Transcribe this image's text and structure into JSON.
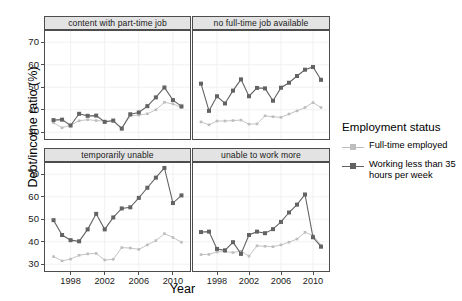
{
  "chart_data": {
    "type": "line",
    "title": "",
    "xlabel": "Year",
    "ylabel": "Debt/income ratio (%)",
    "xlim": [
      1995,
      2012
    ],
    "ylim": [
      27,
      75
    ],
    "xticks": [
      1998,
      2002,
      2006,
      2010
    ],
    "yticks_top": [
      30,
      40,
      50,
      60,
      70
    ],
    "yticks_bottom": [
      30,
      40,
      50,
      60,
      70
    ],
    "grid": true,
    "legend_title": "Employment status",
    "legend_position": "right",
    "series_names": [
      "Full-time employed",
      "Working less than 35 hours per week"
    ],
    "series_colors": [
      "#bdbdbd",
      "#636363"
    ],
    "facets": [
      {
        "label": "content with part-time job",
        "position": "top-left",
        "series": [
          {
            "name": "Full-time employed",
            "color": "#bdbdbd",
            "x": [
              1996,
              1997,
              1998,
              1999,
              2000,
              2001,
              2002,
              2003,
              2004,
              2005,
              2006,
              2007,
              2008,
              2009,
              2010,
              2011
            ],
            "values": [
              34.2,
              32.0,
              33.2,
              35.1,
              35.6,
              35.2,
              35.0,
              34.8,
              32.0,
              37.3,
              37.6,
              38.2,
              40.0,
              43.3,
              42.6,
              41.0
            ]
          },
          {
            "name": "Working less than 35 hours per week",
            "color": "#636363",
            "x": [
              1996,
              1997,
              1998,
              1999,
              2000,
              2001,
              2002,
              2003,
              2004,
              2005,
              2006,
              2007,
              2008,
              2009,
              2010,
              2011
            ],
            "values": [
              35.4,
              35.6,
              33.0,
              38.2,
              37.3,
              37.4,
              34.6,
              35.2,
              31.6,
              38.0,
              38.8,
              41.6,
              45.5,
              49.9,
              44.3,
              41.5
            ]
          }
        ]
      },
      {
        "label": "no full-time job available",
        "position": "top-right",
        "series": [
          {
            "name": "Full-time employed",
            "color": "#bdbdbd",
            "x": [
              1996,
              1997,
              1998,
              1999,
              2000,
              2001,
              2002,
              2003,
              2004,
              2005,
              2006,
              2007,
              2008,
              2009,
              2010,
              2011
            ],
            "values": [
              34.6,
              33.3,
              35.0,
              35.0,
              35.2,
              35.4,
              33.6,
              33.7,
              37.3,
              36.9,
              36.6,
              38.1,
              39.5,
              41.0,
              43.2,
              41.0
            ]
          },
          {
            "name": "Working less than 35 hours per week",
            "color": "#636363",
            "x": [
              1996,
              1997,
              1998,
              1999,
              2000,
              2001,
              2002,
              2003,
              2004,
              2005,
              2006,
              2007,
              2008,
              2009,
              2010,
              2011
            ],
            "values": [
              51.6,
              39.5,
              46.0,
              42.8,
              48.5,
              53.5,
              46.0,
              49.7,
              49.5,
              44.0,
              49.8,
              52.0,
              55.0,
              57.8,
              59.0,
              53.3
            ]
          }
        ]
      },
      {
        "label": "temporarily unable",
        "position": "bottom-left",
        "series": [
          {
            "name": "Full-time employed",
            "color": "#bdbdbd",
            "x": [
              1996,
              1997,
              1998,
              1999,
              2000,
              2001,
              2002,
              2003,
              2004,
              2005,
              2006,
              2007,
              2008,
              2009,
              2010,
              2011
            ],
            "values": [
              33.4,
              31.5,
              32.3,
              34.0,
              34.6,
              34.8,
              31.9,
              32.2,
              37.4,
              37.2,
              36.6,
              38.6,
              40.5,
              43.6,
              41.9,
              39.8
            ]
          },
          {
            "name": "Working less than 35 hours per week",
            "color": "#636363",
            "x": [
              1996,
              1997,
              1998,
              1999,
              2000,
              2001,
              2002,
              2003,
              2004,
              2005,
              2006,
              2007,
              2008,
              2009,
              2010,
              2011
            ],
            "values": [
              49.6,
              43.0,
              40.7,
              40.2,
              45.5,
              52.4,
              45.5,
              50.8,
              54.8,
              55.3,
              59.5,
              64.0,
              68.5,
              72.8,
              57.2,
              60.6
            ]
          }
        ]
      },
      {
        "label": "unable to work more",
        "position": "bottom-right",
        "series": [
          {
            "name": "Full-time employed",
            "color": "#bdbdbd",
            "x": [
              1996,
              1997,
              1998,
              1999,
              2000,
              2001,
              2002,
              2003,
              2004,
              2005,
              2006,
              2007,
              2008,
              2009,
              2010,
              2011
            ],
            "values": [
              34.3,
              34.4,
              35.5,
              35.6,
              35.2,
              35.8,
              33.6,
              38.2,
              38.0,
              37.8,
              38.6,
              39.8,
              41.2,
              44.2,
              42.8,
              38.5
            ]
          },
          {
            "name": "Working less than 35 hours per week",
            "color": "#636363",
            "x": [
              1996,
              1997,
              1998,
              1999,
              2000,
              2001,
              2002,
              2003,
              2004,
              2005,
              2006,
              2007,
              2008,
              2009,
              2010,
              2011
            ],
            "values": [
              44.3,
              44.5,
              36.8,
              36.2,
              39.8,
              34.6,
              43.0,
              44.5,
              43.8,
              45.6,
              48.8,
              53.0,
              56.5,
              61.0,
              42.0,
              37.8
            ]
          }
        ]
      }
    ]
  },
  "axis": {
    "y_title": "Debt/income ratio (%)",
    "x_title": "Year",
    "y_labels_top": [
      "70",
      "60",
      "50",
      "40",
      "30"
    ],
    "y_labels_bottom": [
      "70",
      "60",
      "50",
      "40",
      "30"
    ],
    "x_labels": [
      "1998",
      "2002",
      "2006",
      "2010"
    ]
  },
  "strips": {
    "top_left": "content with part-time job",
    "top_right": "no full-time job available",
    "bottom_left": "temporarily unable",
    "bottom_right": "unable to work more"
  },
  "legend": {
    "title": "Employment status",
    "items": [
      {
        "label": "Full-time employed",
        "color": "#bdbdbd"
      },
      {
        "label": "Working less than 35 hours per week",
        "color": "#636363"
      }
    ]
  }
}
